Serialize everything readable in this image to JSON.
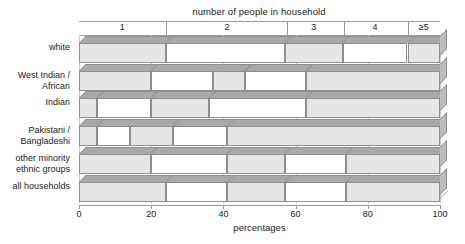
{
  "chart_data": {
    "type": "bar",
    "orientation": "horizontal",
    "stacked": true,
    "percent_stacked": true,
    "title": "number of people in household",
    "xlabel": "percentages",
    "ylabel": "",
    "xlim": [
      0,
      100
    ],
    "xticks": [
      "0",
      "20",
      "40",
      "60",
      "80",
      "100"
    ],
    "xtick_values": [
      0,
      20,
      40,
      60,
      80,
      100
    ],
    "grid": true,
    "legend_position": "top",
    "legend": [
      "1",
      "2",
      "3",
      "4",
      "≥5"
    ],
    "series": [
      {
        "name": "1",
        "values": [
          24,
          20,
          5,
          5,
          20,
          24
        ]
      },
      {
        "name": "2",
        "values": [
          33,
          17,
          15,
          9,
          21,
          17
        ]
      },
      {
        "name": "3",
        "values": [
          16,
          9,
          16,
          12,
          16,
          16
        ]
      },
      {
        "name": "4",
        "values": [
          18,
          17,
          27,
          15,
          17,
          17
        ]
      },
      {
        "name": "≥5",
        "values": [
          9,
          37,
          37,
          59,
          26,
          26
        ]
      }
    ],
    "categories": [
      "white",
      "West Indian /\nAfrican",
      "Indian",
      "Pakistani /\nBangladeshi",
      "other minority\nethnic groups",
      "all households"
    ],
    "cumulative_boundaries": [
      [
        24,
        57,
        73,
        91
      ],
      [
        20,
        37,
        46,
        63
      ],
      [
        5,
        20,
        36,
        63
      ],
      [
        5,
        14,
        26,
        41
      ],
      [
        20,
        41,
        57,
        74
      ],
      [
        24,
        41,
        57,
        74
      ]
    ],
    "segment_shading": [
      "filled",
      "empty",
      "filled",
      "empty",
      "filled"
    ],
    "colors": {
      "front_filled": "#e6e6e6",
      "front_empty": "#ffffff",
      "top_face": "#a9a9a9",
      "side_face": "#bdbdbd",
      "outline": "#8e8e8e",
      "gridline": "#c9c9c9",
      "axis": "#9a9a9a",
      "text": "#1a1a1a",
      "background": "#ffffff"
    }
  },
  "top_scale": {
    "labels": [
      "1",
      "2",
      "3",
      "4",
      "≥5"
    ],
    "label_centers_pct": [
      12,
      41,
      65,
      82,
      95.5
    ],
    "boundaries_pct": [
      24,
      57.5,
      73.5,
      91
    ]
  },
  "rows": [
    {
      "label": "white",
      "boundaries": [
        24,
        57,
        73,
        91
      ]
    },
    {
      "label": "West Indian /\nAfrican",
      "boundaries": [
        20,
        37,
        46,
        63
      ]
    },
    {
      "label": "Indian",
      "boundaries": [
        5,
        20,
        36,
        63
      ]
    },
    {
      "label": "Pakistani /\nBangladeshi",
      "boundaries": [
        5,
        14,
        26,
        41
      ]
    },
    {
      "label": "other minority\nethnic groups",
      "boundaries": [
        20,
        41,
        57,
        74
      ]
    },
    {
      "label": "all households",
      "boundaries": [
        24,
        41,
        57,
        74
      ]
    }
  ],
  "axis": {
    "caption": "percentages",
    "ticks": [
      "0",
      "20",
      "40",
      "60",
      "80",
      "100"
    ]
  },
  "title": "number of people in household"
}
